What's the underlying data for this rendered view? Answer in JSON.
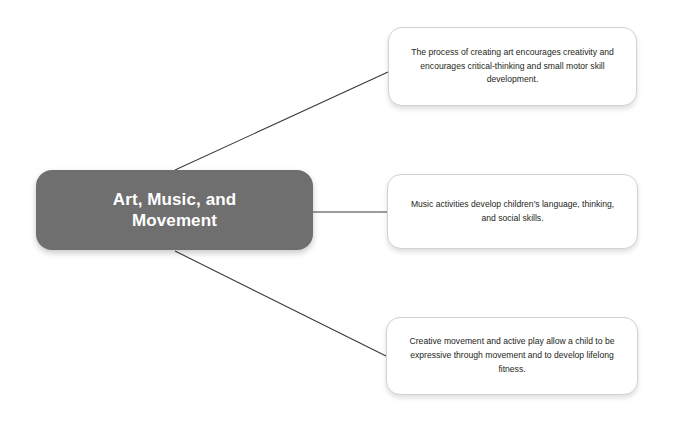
{
  "diagram": {
    "type": "mind-map",
    "background_color": "#ffffff",
    "root": {
      "label": "Art, Music, and\nMovement",
      "fill_color": "#6f6f6f",
      "text_color": "#ffffff"
    },
    "branches": [
      {
        "id": "art",
        "text": "The process of creating art encourages creativity and encourages critical-thinking and small motor skill development.",
        "fill_color": "#ffffff",
        "text_color": "#231f20"
      },
      {
        "id": "music",
        "text": "Music activities develop children's language, thinking, and social skills.",
        "fill_color": "#ffffff",
        "text_color": "#231f20"
      },
      {
        "id": "movement",
        "text": "Creative movement and active play allow a child to be expressive through movement and to develop lifelong fitness.",
        "fill_color": "#ffffff",
        "text_color": "#231f20"
      }
    ],
    "connectors": [
      {
        "id": "connector-root-to-art",
        "from": [
          175,
          170
        ],
        "to": [
          388,
          72
        ],
        "color": "#3a3a3a"
      },
      {
        "id": "connector-root-to-music",
        "from": [
          313,
          212
        ],
        "to": [
          387,
          212
        ],
        "color": "#3a3a3a"
      },
      {
        "id": "connector-root-to-movement",
        "from": [
          175,
          251
        ],
        "to": [
          386,
          356
        ],
        "color": "#3a3a3a"
      }
    ]
  }
}
